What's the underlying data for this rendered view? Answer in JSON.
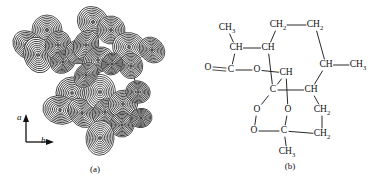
{
  "figure": {
    "panels": [
      {
        "id": "a",
        "caption": "(a)",
        "type": "electron-density-contour-map",
        "axes": [
          {
            "name": "a-axis",
            "label": "a",
            "direction": "up"
          },
          {
            "name": "b-axis",
            "label": "b",
            "direction": "right"
          }
        ]
      },
      {
        "id": "b",
        "caption": "(b)",
        "type": "chemical-structural-formula"
      }
    ]
  },
  "contour_map": {
    "contour_levels": 9,
    "line_color": "#1a1a1a",
    "background": "#ffffff",
    "atoms": [
      {
        "id": "m1",
        "x": 47,
        "y": 30,
        "r": 15
      },
      {
        "id": "m2",
        "x": 28,
        "y": 45,
        "r": 14
      },
      {
        "id": "m3",
        "x": 38,
        "y": 55,
        "r": 16
      },
      {
        "id": "m4",
        "x": 58,
        "y": 45,
        "r": 13
      },
      {
        "id": "m5",
        "x": 63,
        "y": 62,
        "r": 12
      },
      {
        "id": "m6",
        "x": 78,
        "y": 52,
        "r": 12
      },
      {
        "id": "m7",
        "x": 93,
        "y": 22,
        "r": 16
      },
      {
        "id": "m8",
        "x": 111,
        "y": 30,
        "r": 14
      },
      {
        "id": "m9",
        "x": 86,
        "y": 45,
        "r": 13
      },
      {
        "id": "m10",
        "x": 98,
        "y": 60,
        "r": 14
      },
      {
        "id": "m11",
        "x": 129,
        "y": 47,
        "r": 15
      },
      {
        "id": "m12",
        "x": 152,
        "y": 50,
        "r": 13
      },
      {
        "id": "m13",
        "x": 131,
        "y": 66,
        "r": 12
      },
      {
        "id": "m14",
        "x": 112,
        "y": 64,
        "r": 11
      },
      {
        "id": "m15",
        "x": 72,
        "y": 93,
        "r": 16
      },
      {
        "id": "m16",
        "x": 60,
        "y": 110,
        "r": 15
      },
      {
        "id": "m17",
        "x": 82,
        "y": 113,
        "r": 14
      },
      {
        "id": "m18",
        "x": 100,
        "y": 92,
        "r": 16
      },
      {
        "id": "m19",
        "x": 105,
        "y": 112,
        "r": 13
      },
      {
        "id": "m20",
        "x": 123,
        "y": 104,
        "r": 14
      },
      {
        "id": "m21",
        "x": 138,
        "y": 92,
        "r": 12
      },
      {
        "id": "m22",
        "x": 122,
        "y": 125,
        "r": 12
      },
      {
        "id": "m23",
        "x": 100,
        "y": 138,
        "r": 15
      },
      {
        "id": "m24",
        "x": 86,
        "y": 75,
        "r": 12
      },
      {
        "id": "m25",
        "x": 141,
        "y": 118,
        "r": 10
      }
    ],
    "bonds": [
      [
        "m1",
        "m2"
      ],
      [
        "m2",
        "m3"
      ],
      [
        "m3",
        "m4"
      ],
      [
        "m4",
        "m1"
      ],
      [
        "m4",
        "m5"
      ],
      [
        "m5",
        "m6"
      ],
      [
        "m6",
        "m9"
      ],
      [
        "m9",
        "m7"
      ],
      [
        "m7",
        "m8"
      ],
      [
        "m8",
        "m11"
      ],
      [
        "m11",
        "m12"
      ],
      [
        "m11",
        "m13"
      ],
      [
        "m13",
        "m14"
      ],
      [
        "m14",
        "m10"
      ],
      [
        "m10",
        "m9"
      ],
      [
        "m10",
        "m18"
      ],
      [
        "m18",
        "m15"
      ],
      [
        "m15",
        "m24"
      ],
      [
        "m24",
        "m6"
      ],
      [
        "m15",
        "m16"
      ],
      [
        "m16",
        "m17"
      ],
      [
        "m17",
        "m19"
      ],
      [
        "m19",
        "m18"
      ],
      [
        "m19",
        "m20"
      ],
      [
        "m20",
        "m21"
      ],
      [
        "m20",
        "m22"
      ],
      [
        "m22",
        "m23"
      ],
      [
        "m21",
        "m13"
      ],
      [
        "m20",
        "m25"
      ]
    ]
  },
  "structure": {
    "name": "artemisinin",
    "labels": [
      {
        "id": "ch3-top-left",
        "text": "CH",
        "sub": "3",
        "x": 35,
        "y": 28
      },
      {
        "id": "ch-left",
        "text": "CH",
        "sub": "",
        "x": 44,
        "y": 48
      },
      {
        "id": "ch-top-mid",
        "text": "CH",
        "sub": "",
        "x": 76,
        "y": 48
      },
      {
        "id": "ch2-top-a",
        "text": "CH",
        "sub": "2",
        "x": 86,
        "y": 25
      },
      {
        "id": "ch2-top-b",
        "text": "CH",
        "sub": "2",
        "x": 123,
        "y": 25
      },
      {
        "id": "o-carbonyl",
        "text": "O",
        "sub": "",
        "x": 16,
        "y": 68
      },
      {
        "id": "c-carbonyl",
        "text": "C",
        "sub": "",
        "x": 39,
        "y": 70
      },
      {
        "id": "o-ester",
        "text": "O",
        "sub": "",
        "x": 65,
        "y": 70
      },
      {
        "id": "ch-ring-upper",
        "text": "CH",
        "sub": "",
        "x": 94,
        "y": 73
      },
      {
        "id": "c-quaternary",
        "text": "C",
        "sub": "",
        "x": 81,
        "y": 90
      },
      {
        "id": "ch-right-upper",
        "text": "CH",
        "sub": "",
        "x": 134,
        "y": 65
      },
      {
        "id": "ch3-right",
        "text": "CH",
        "sub": "3",
        "x": 166,
        "y": 65
      },
      {
        "id": "ch-right-lower",
        "text": "CH",
        "sub": "",
        "x": 119,
        "y": 90
      },
      {
        "id": "o-peroxide-1",
        "text": "O",
        "sub": "",
        "x": 65,
        "y": 110
      },
      {
        "id": "o-acetal",
        "text": "O",
        "sub": "",
        "x": 96,
        "y": 110
      },
      {
        "id": "o-peroxide-2",
        "text": "O",
        "sub": "",
        "x": 62,
        "y": 131
      },
      {
        "id": "c-acetal",
        "text": "C",
        "sub": "",
        "x": 92,
        "y": 131
      },
      {
        "id": "ch2-right-mid",
        "text": "CH",
        "sub": "2",
        "x": 130,
        "y": 110
      },
      {
        "id": "ch2-right-low",
        "text": "CH",
        "sub": "2",
        "x": 130,
        "y": 134
      },
      {
        "id": "ch3-bottom",
        "text": "CH",
        "sub": "3",
        "x": 95,
        "y": 152
      }
    ],
    "bonds": [
      {
        "from": "ch3-top-left",
        "to": "ch-left"
      },
      {
        "from": "ch-left",
        "to": "ch-top-mid"
      },
      {
        "from": "ch-top-mid",
        "to": "ch2-top-a"
      },
      {
        "from": "ch2-top-a",
        "to": "ch2-top-b"
      },
      {
        "from": "ch2-top-b",
        "to": "ch-right-upper"
      },
      {
        "from": "ch-right-upper",
        "to": "ch3-right"
      },
      {
        "from": "ch-right-upper",
        "to": "ch-right-lower"
      },
      {
        "from": "ch-left",
        "to": "c-carbonyl"
      },
      {
        "from": "c-carbonyl",
        "to": "o-carbonyl",
        "order": 2
      },
      {
        "from": "c-carbonyl",
        "to": "o-ester"
      },
      {
        "from": "o-ester",
        "to": "ch-ring-upper"
      },
      {
        "from": "ch-top-mid",
        "to": "c-quaternary"
      },
      {
        "from": "ch-ring-upper",
        "to": "c-quaternary"
      },
      {
        "from": "c-quaternary",
        "to": "ch-right-lower"
      },
      {
        "from": "c-quaternary",
        "to": "o-peroxide-1"
      },
      {
        "from": "ch-ring-upper",
        "to": "o-acetal"
      },
      {
        "from": "o-peroxide-1",
        "to": "o-peroxide-2"
      },
      {
        "from": "o-acetal",
        "to": "c-acetal"
      },
      {
        "from": "o-peroxide-2",
        "to": "c-acetal"
      },
      {
        "from": "c-acetal",
        "to": "ch3-bottom"
      },
      {
        "from": "c-acetal",
        "to": "ch2-right-low"
      },
      {
        "from": "ch2-right-low",
        "to": "ch2-right-mid"
      },
      {
        "from": "ch2-right-mid",
        "to": "ch-right-lower"
      }
    ]
  }
}
